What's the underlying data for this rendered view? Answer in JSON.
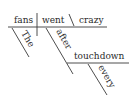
{
  "diagram": {
    "type": "sentence-diagram",
    "sentence_words": [
      "The",
      "fans",
      "went",
      "crazy",
      "after",
      "every",
      "touchdown"
    ],
    "baseline": {
      "subject": "fans",
      "verb": "went",
      "predicate_complement": "crazy"
    },
    "modifiers": {
      "subject_modifier": "The",
      "verb_modifier_preposition": "after",
      "object_of_preposition": "touchdown",
      "object_modifier": "every"
    },
    "colors": {
      "line": "#3a3a3a",
      "text": "#2a2a2a",
      "background": "#ffffff"
    }
  }
}
